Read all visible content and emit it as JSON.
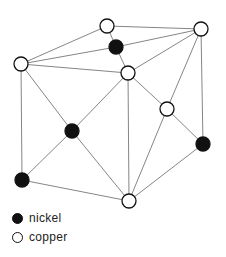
{
  "colors": {
    "nickel": "#111111",
    "copper": "#ffffff",
    "edge": "#777777",
    "outline": "#111111"
  },
  "nodes": [
    {
      "id": "top-center",
      "x": 107,
      "y": 26,
      "element": "copper"
    },
    {
      "id": "top-right",
      "x": 201,
      "y": 29,
      "element": "copper"
    },
    {
      "id": "top-inner",
      "x": 116,
      "y": 47,
      "element": "nickel"
    },
    {
      "id": "left",
      "x": 21,
      "y": 64,
      "element": "copper"
    },
    {
      "id": "center",
      "x": 128,
      "y": 73,
      "element": "copper"
    },
    {
      "id": "right-mid",
      "x": 167,
      "y": 109,
      "element": "copper"
    },
    {
      "id": "mid-left",
      "x": 72,
      "y": 131,
      "element": "nickel"
    },
    {
      "id": "right",
      "x": 203,
      "y": 144,
      "element": "nickel"
    },
    {
      "id": "bottom-left",
      "x": 22,
      "y": 180,
      "element": "nickel"
    },
    {
      "id": "bottom",
      "x": 129,
      "y": 201,
      "element": "copper"
    }
  ],
  "edges": [
    [
      "top-center",
      "top-right"
    ],
    [
      "top-center",
      "left"
    ],
    [
      "top-center",
      "top-inner"
    ],
    [
      "top-inner",
      "left"
    ],
    [
      "top-inner",
      "top-right"
    ],
    [
      "top-inner",
      "center"
    ],
    [
      "left",
      "center"
    ],
    [
      "left",
      "mid-left"
    ],
    [
      "left",
      "bottom-left"
    ],
    [
      "center",
      "top-right"
    ],
    [
      "center",
      "mid-left"
    ],
    [
      "center",
      "bottom"
    ],
    [
      "center",
      "right-mid"
    ],
    [
      "top-right",
      "right-mid"
    ],
    [
      "top-right",
      "right"
    ],
    [
      "right-mid",
      "right"
    ],
    [
      "right-mid",
      "bottom"
    ],
    [
      "mid-left",
      "bottom-left"
    ],
    [
      "mid-left",
      "bottom"
    ],
    [
      "bottom-left",
      "bottom"
    ],
    [
      "right",
      "bottom"
    ]
  ],
  "legend": {
    "items": [
      {
        "label": "nickel",
        "element": "nickel"
      },
      {
        "label": "copper",
        "element": "copper"
      }
    ]
  }
}
